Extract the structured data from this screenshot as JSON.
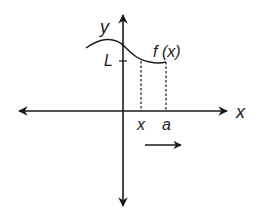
{
  "diagram": {
    "type": "function-limit-graph",
    "labels": {
      "y_axis": "y",
      "x_axis": "x",
      "curve": "f (x)",
      "limit": "L",
      "x_point": "x",
      "a_point": "a"
    },
    "colors": {
      "stroke": "#1a1a1a",
      "background": "#ffffff"
    },
    "annotations": {
      "direction_arrow": "right"
    }
  }
}
